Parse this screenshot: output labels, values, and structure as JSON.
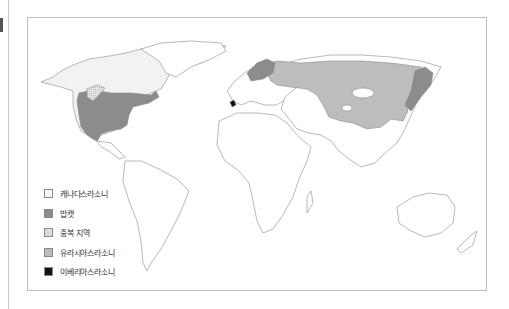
{
  "map": {
    "colors": {
      "canada_lynx": "#f2f2f2",
      "bobcat": "#8c8c8c",
      "overlap": "#d8d8d8",
      "eurasian_lynx": "#bdbdbd",
      "iberian_lynx": "#111111",
      "outline": "#888888"
    },
    "legend": [
      {
        "label": "캐나다스라소니",
        "key": "canada_lynx"
      },
      {
        "label": "밥캣",
        "key": "bobcat"
      },
      {
        "label": "중복 지역",
        "key": "overlap"
      },
      {
        "label": "유라시아스라소니",
        "key": "eurasian_lynx"
      },
      {
        "label": "이베리아스라소니",
        "key": "iberian_lynx"
      }
    ]
  }
}
